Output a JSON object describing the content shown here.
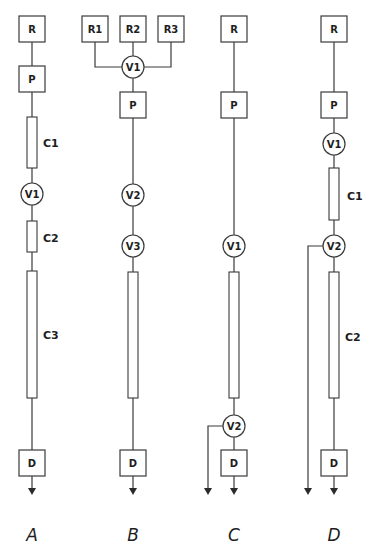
{
  "panels": [
    {
      "id": "A",
      "label": "A",
      "nodes": {
        "R": "R",
        "P": "P",
        "C1": "C1",
        "V1": "V1",
        "C2": "C2",
        "C3": "C3",
        "D": "D"
      }
    },
    {
      "id": "B",
      "label": "B",
      "nodes": {
        "R1": "R1",
        "R2": "R2",
        "R3": "R3",
        "V1": "V1",
        "P": "P",
        "V2": "V2",
        "V3": "V3",
        "D": "D"
      }
    },
    {
      "id": "C",
      "label": "C",
      "nodes": {
        "R": "R",
        "P": "P",
        "V1": "V1",
        "V2": "V2",
        "D": "D"
      }
    },
    {
      "id": "D",
      "label": "D",
      "nodes": {
        "R": "R",
        "P": "P",
        "V1": "V1",
        "C1": "C1",
        "V2": "V2",
        "C2": "C2",
        "D": "D"
      }
    }
  ],
  "colors": {
    "stroke": "#3a3a3a",
    "text": "#1e1e1e",
    "background": "#ffffff"
  }
}
